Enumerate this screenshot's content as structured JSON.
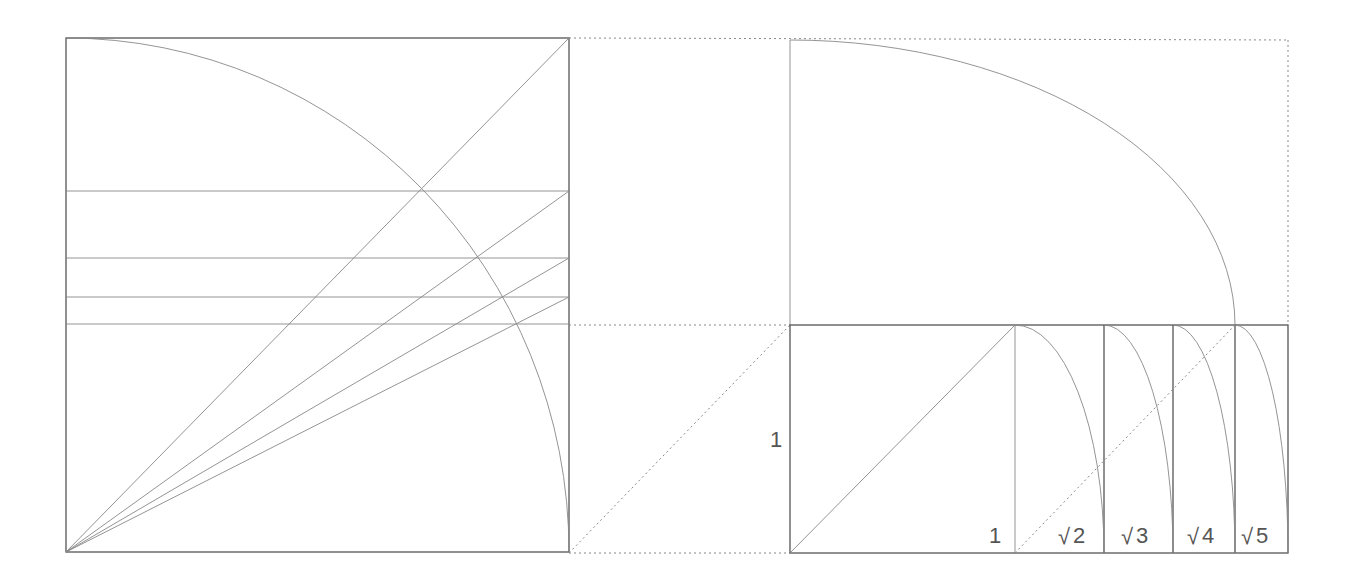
{
  "colors": {
    "line": "#555555",
    "light_line": "#888888",
    "background": "#ffffff"
  },
  "left_figure": {
    "square": {
      "x": 66,
      "y": 38,
      "w": 503,
      "h": 514
    },
    "arc_center": [
      66,
      552
    ],
    "horizontal_lines_y": [
      191,
      258,
      297,
      324
    ],
    "diagonal_targets": [
      [
        569,
        38
      ],
      [
        569,
        191
      ],
      [
        569,
        258
      ],
      [
        569,
        297
      ]
    ]
  },
  "right_figure": {
    "outer_rect_dotted": {
      "x": 790,
      "y": 40,
      "w": 498,
      "h": 285
    },
    "base_rect": {
      "x": 790,
      "y": 325,
      "w": 498,
      "h": 228
    },
    "verticals_x": [
      1015,
      1104,
      1173,
      1235,
      1288
    ]
  },
  "labels": {
    "side_unit": "1",
    "base_unit": "1",
    "root2": "2",
    "root3": "3",
    "root4": "4",
    "root5": "5",
    "radical": "√"
  }
}
